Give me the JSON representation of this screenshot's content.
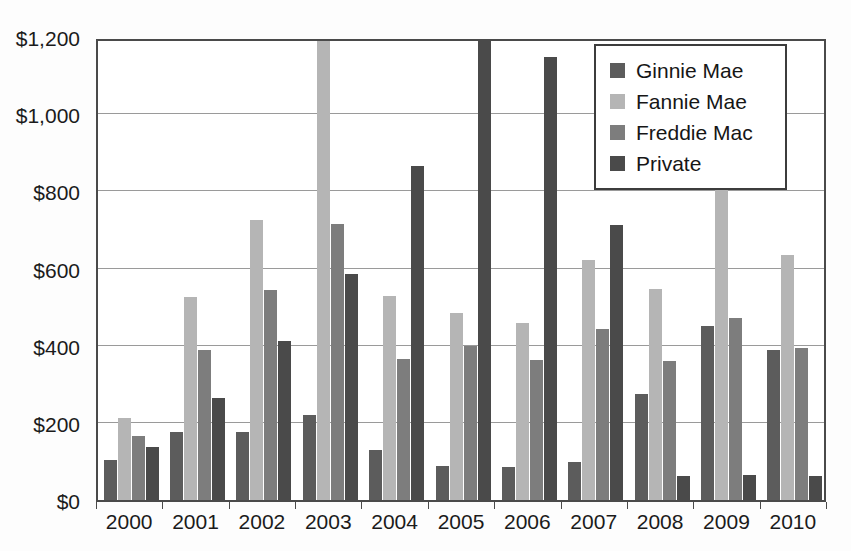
{
  "chart_data": {
    "type": "bar",
    "title": "",
    "subtitle": "",
    "xlabel": "",
    "ylabel": "",
    "categories": [
      "2000",
      "2001",
      "2002",
      "2003",
      "2004",
      "2005",
      "2006",
      "2007",
      "2008",
      "2009",
      "2010"
    ],
    "series": [
      {
        "name": "Ginnie Mae",
        "color": "#5c5c5c",
        "values": [
          105,
          175,
          175,
          220,
          130,
          88,
          85,
          98,
          275,
          452,
          390
        ]
      },
      {
        "name": "Fannie Mae",
        "color": "#b5b5b5",
        "values": [
          213,
          525,
          725,
          1260,
          528,
          485,
          458,
          622,
          547,
          812,
          635
        ]
      },
      {
        "name": "Freddie Mac",
        "color": "#7d7d7d",
        "values": [
          167,
          390,
          545,
          715,
          365,
          400,
          363,
          443,
          360,
          473,
          393
        ]
      },
      {
        "name": "Private",
        "color": "#4a4a4a",
        "values": [
          137,
          265,
          413,
          585,
          865,
          1195,
          1148,
          712,
          63,
          65,
          63
        ]
      }
    ],
    "ylim": [
      0,
      1200
    ],
    "ytick_values": [
      0,
      200,
      400,
      600,
      800,
      1000,
      1200
    ],
    "ytick_labels": [
      "$0",
      "$200",
      "$400",
      "$600",
      "$800",
      "$1,000",
      "$1,200"
    ],
    "grid": true,
    "grid_axis": "y",
    "legend_position": "top-right",
    "value_prefix": "$",
    "value_unit": "billions"
  },
  "legend": {
    "items": [
      {
        "label": "Ginnie Mae",
        "color": "#5c5c5c"
      },
      {
        "label": "Fannie Mae",
        "color": "#b5b5b5"
      },
      {
        "label": "Freddie Mac",
        "color": "#7d7d7d"
      },
      {
        "label": "Private",
        "color": "#4a4a4a"
      }
    ]
  },
  "axes": {
    "y_labels": [
      "$1,200",
      "$1,000",
      "$800",
      "$600",
      "$400",
      "$200",
      "$0"
    ],
    "x_labels": [
      "2000",
      "2001",
      "2002",
      "2003",
      "2004",
      "2005",
      "2006",
      "2007",
      "2008",
      "2009",
      "2010"
    ]
  }
}
